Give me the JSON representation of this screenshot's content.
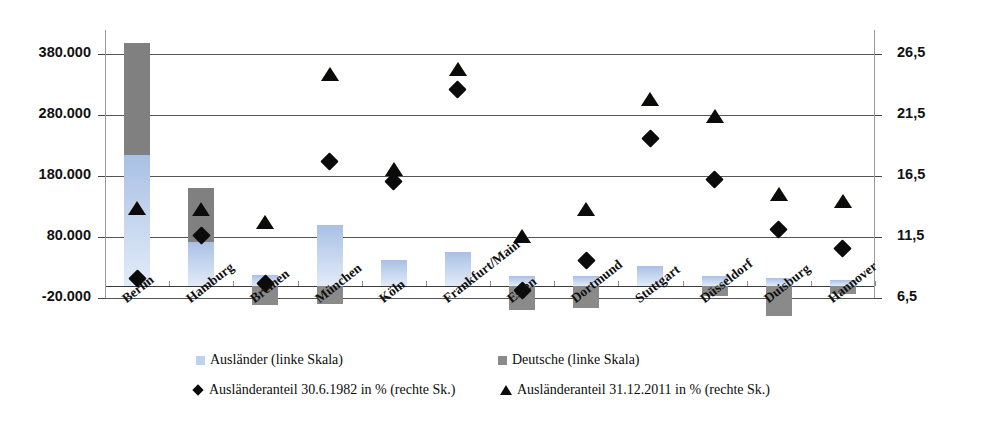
{
  "chart_data": {
    "type": "bar",
    "title": "",
    "xlabel": "",
    "ylabel_left": "",
    "ylabel_right": "",
    "categories": [
      "Berlin",
      "Hamburg",
      "Bremen",
      "München",
      "Köln",
      "Frankfurt/Main",
      "Essen",
      "Dortmund",
      "Stuttgart",
      "Düsseldorf",
      "Duisburg",
      "Hannover"
    ],
    "left_axis": {
      "ticks": [
        "380.000",
        "280.000",
        "180.000",
        "80.000",
        "-20.000"
      ],
      "values": [
        380000,
        280000,
        180000,
        80000,
        -20000
      ],
      "ylim": [
        -20000,
        420000
      ]
    },
    "right_axis": {
      "ticks": [
        "26,5",
        "21,5",
        "16,5",
        "11,5",
        "6,5"
      ],
      "values": [
        26.5,
        21.5,
        16.5,
        11.5,
        6.5
      ],
      "ylim": [
        6.5,
        28.5
      ]
    },
    "grid": true,
    "legend_position": "bottom",
    "series": [
      {
        "name": "Ausländer (linke Skala)",
        "axis": "left",
        "kind": "bar-stacked",
        "color": "#bed2ec",
        "values": [
          215000,
          72000,
          17000,
          100000,
          43000,
          56000,
          16000,
          16000,
          33000,
          16000,
          13000,
          10000
        ]
      },
      {
        "name": "Deutsche (linke Skala)",
        "axis": "left",
        "kind": "bar-stacked",
        "color": "#808080",
        "values": [
          183000,
          89000,
          -32000,
          -30000,
          0,
          0,
          -39000,
          -36000,
          0,
          -17000,
          -50000,
          -14000
        ]
      },
      {
        "name": "Ausländeranteil 30.6.1982 in % (rechte Sk.)",
        "axis": "right",
        "kind": "scatter-diamond",
        "color": "#0b0b0b",
        "values": [
          8.1,
          11.6,
          7.7,
          17.7,
          16.1,
          23.6,
          7.1,
          9.6,
          19.6,
          16.2,
          12.1,
          10.6
        ]
      },
      {
        "name": "Ausländeranteil 31.12.2011 in % (rechte Sk.)",
        "axis": "right",
        "kind": "scatter-triangle",
        "color": "#0b0b0b",
        "values": [
          13.9,
          13.8,
          12.7,
          24.9,
          17.1,
          25.3,
          11.6,
          13.8,
          22.8,
          21.4,
          15.0,
          14.5
        ]
      }
    ]
  },
  "legend": {
    "items": [
      {
        "label": "Ausländer (linke Skala)",
        "marker": "square-blue"
      },
      {
        "label": "Deutsche (linke Skala)",
        "marker": "square-gray"
      },
      {
        "label": "Ausländeranteil 30.6.1982 in % (rechte Sk.)",
        "marker": "diamond"
      },
      {
        "label": "Ausländeranteil 31.12.2011 in % (rechte Sk.)",
        "marker": "triangle"
      }
    ]
  },
  "colors": {
    "auslaender": "#bed2ec",
    "deutsche": "#808080",
    "marker": "#0b0b0b",
    "grid": "#555555",
    "frame": "#333333"
  }
}
